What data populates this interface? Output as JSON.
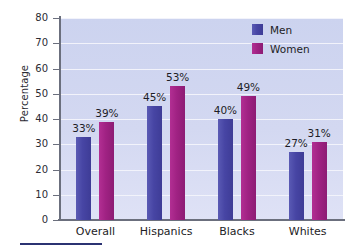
{
  "chart_data": {
    "type": "bar",
    "title": "",
    "subtitle": "",
    "xlabel": "",
    "ylabel": "Percentage",
    "ylim": [
      0,
      80
    ],
    "ytick_step": 10,
    "yticks": [
      80,
      70,
      60,
      50,
      40,
      30,
      20,
      10,
      0
    ],
    "grid": true,
    "legend_position": "top-right",
    "value_suffix": "%",
    "categories": [
      "Overall",
      "Hispanics",
      "Blacks",
      "Whites"
    ],
    "series": [
      {
        "name": "Men",
        "color": "#4745a4",
        "values": [
          33,
          45,
          40,
          27
        ],
        "labels": [
          "33%",
          "45%",
          "40%",
          "27%"
        ]
      },
      {
        "name": "Women",
        "color": "#a02283",
        "values": [
          39,
          53,
          49,
          31
        ],
        "labels": [
          "39%",
          "53%",
          "49%",
          "31%"
        ]
      }
    ]
  },
  "axis": {
    "y_title": "Percentage",
    "y_tick_labels": [
      "80",
      "70",
      "60",
      "50",
      "40",
      "30",
      "20",
      "10",
      "0"
    ],
    "x_tick_labels": [
      "Overall",
      "Hispanics",
      "Blacks",
      "Whites"
    ]
  },
  "legend": {
    "entries": [
      {
        "label": "Men",
        "color": "#4745a4"
      },
      {
        "label": "Women",
        "color": "#a02283"
      }
    ]
  },
  "colors": {
    "plot_background": "#d3d8f1",
    "gridline": "#f2f3fb",
    "axis": "#6b6f7d",
    "men": "#4745a4",
    "women": "#a02283",
    "text": "#1d1d26",
    "footer_rule": "#2b3272"
  }
}
